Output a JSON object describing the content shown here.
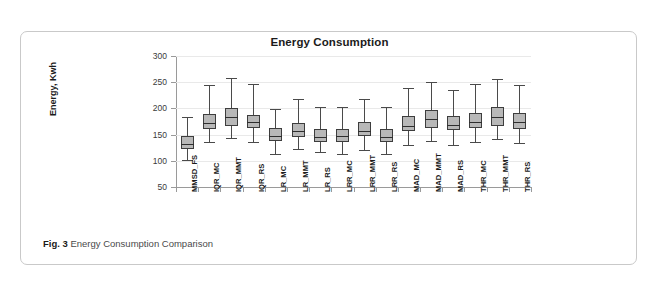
{
  "figure": {
    "caption_label": "Fig. 3",
    "caption_text": "Energy Consumption Comparison"
  },
  "chart_data": {
    "type": "box",
    "title": "Energy Consumption",
    "xlabel": "",
    "ylabel": "Energy, Kwh",
    "ylim": [
      50,
      300
    ],
    "yticks": [
      50,
      100,
      150,
      200,
      250,
      300
    ],
    "grid": true,
    "legend": null,
    "categories": [
      "MMSD_FS",
      "IQR_MC",
      "IQR_MMT",
      "IQR_RS",
      "LR_MC",
      "LR_MMT",
      "LR_RS",
      "LRR_MC",
      "LRR_MMT",
      "LRR_RS",
      "MAD_MC",
      "MAD_MMT",
      "MAD_RS",
      "THR_MC",
      "THR_MMT",
      "THR_RS"
    ],
    "boxes": [
      {
        "category": "MMSD_FS",
        "whisker_low": 102,
        "q1": 123,
        "median": 133,
        "q3": 147,
        "whisker_high": 184
      },
      {
        "category": "IQR_MC",
        "whisker_low": 136,
        "q1": 161,
        "median": 173,
        "q3": 190,
        "whisker_high": 245
      },
      {
        "category": "IQR_MMT",
        "whisker_low": 144,
        "q1": 167,
        "median": 184,
        "q3": 201,
        "whisker_high": 258
      },
      {
        "category": "IQR_RS",
        "whisker_low": 136,
        "q1": 163,
        "median": 175,
        "q3": 188,
        "whisker_high": 247
      },
      {
        "category": "LR_MC",
        "whisker_low": 113,
        "q1": 138,
        "median": 147,
        "q3": 162,
        "whisker_high": 199
      },
      {
        "category": "LR_MMT",
        "whisker_low": 123,
        "q1": 146,
        "median": 157,
        "q3": 173,
        "whisker_high": 217
      },
      {
        "category": "LR_RS",
        "whisker_low": 117,
        "q1": 136,
        "median": 146,
        "q3": 160,
        "whisker_high": 203
      },
      {
        "category": "LRR_MC",
        "whisker_low": 113,
        "q1": 136,
        "median": 147,
        "q3": 160,
        "whisker_high": 202
      },
      {
        "category": "LRR_MMT",
        "whisker_low": 121,
        "q1": 147,
        "median": 157,
        "q3": 174,
        "whisker_high": 217
      },
      {
        "category": "LRR_RS",
        "whisker_low": 113,
        "q1": 136,
        "median": 145,
        "q3": 160,
        "whisker_high": 202
      },
      {
        "category": "MAD_MC",
        "whisker_low": 131,
        "q1": 156,
        "median": 167,
        "q3": 185,
        "whisker_high": 239
      },
      {
        "category": "MAD_MMT",
        "whisker_low": 138,
        "q1": 163,
        "median": 179,
        "q3": 197,
        "whisker_high": 250
      },
      {
        "category": "MAD_RS",
        "whisker_low": 131,
        "q1": 158,
        "median": 169,
        "q3": 186,
        "whisker_high": 236
      },
      {
        "category": "THR_MC",
        "whisker_low": 136,
        "q1": 163,
        "median": 175,
        "q3": 191,
        "whisker_high": 246
      },
      {
        "category": "THR_MMT",
        "whisker_low": 142,
        "q1": 167,
        "median": 183,
        "q3": 202,
        "whisker_high": 256
      },
      {
        "category": "THR_RS",
        "whisker_low": 134,
        "q1": 161,
        "median": 175,
        "q3": 192,
        "whisker_high": 245
      }
    ]
  }
}
